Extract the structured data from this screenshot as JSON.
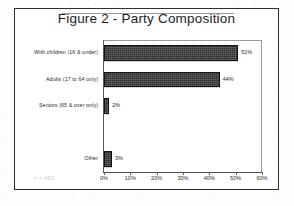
{
  "figure": {
    "title": "Figure 2 -  Party Composition",
    "sample_note": "n = 462",
    "frame_color": "#2e2e2e",
    "bar_color": "#2a2a2a"
  },
  "chart_data": {
    "type": "bar",
    "orientation": "horizontal",
    "title": "Figure 2 -  Party Composition",
    "xlabel": "",
    "ylabel": "",
    "categories": [
      "With children (16 & under)",
      "Adults (17 to 64 only)",
      "Seniors (65 & over only)",
      "",
      "Other"
    ],
    "values": [
      51,
      44,
      2,
      null,
      3
    ],
    "value_labels": [
      "51%",
      "44%",
      "2%",
      "",
      "3%"
    ],
    "xlim": [
      0,
      60
    ],
    "xticks": [
      0,
      10,
      20,
      30,
      40,
      50,
      60
    ],
    "xticklabels": [
      "0%",
      "10%",
      "20%",
      "30%",
      "40%",
      "50%",
      "60%"
    ],
    "grid": false,
    "legend": false,
    "annotation": "n = 462"
  }
}
